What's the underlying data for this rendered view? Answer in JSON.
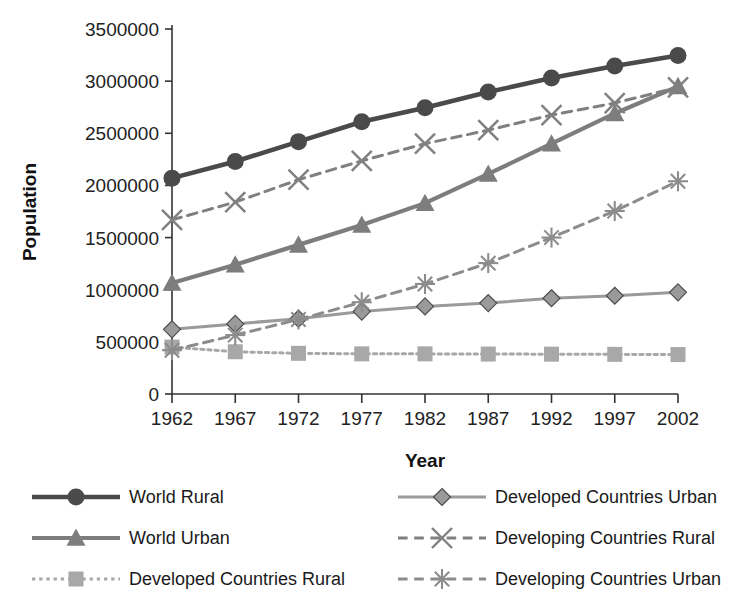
{
  "chart_data": {
    "type": "line",
    "title": "",
    "xlabel": "Year",
    "ylabel": "Population",
    "x": [
      1962,
      1967,
      1972,
      1977,
      1982,
      1987,
      1992,
      1997,
      2002
    ],
    "xtick_labels": [
      "1962",
      "1967",
      "1972",
      "1977",
      "1982",
      "1987",
      "1992",
      "1997",
      "2002"
    ],
    "ytick_labels": [
      "0",
      "500000",
      "1000000",
      "1500000",
      "2000000",
      "2500000",
      "3000000",
      "3500000"
    ],
    "yticks": [
      0,
      500000,
      1000000,
      1500000,
      2000000,
      2500000,
      3000000,
      3500000
    ],
    "ylim": [
      0,
      3500000
    ],
    "grid": false,
    "legend_position": "bottom",
    "series": [
      {
        "name": "World Rural",
        "marker": "circle",
        "dash": "solid",
        "color": "#4a4a4a",
        "values": [
          2070000,
          2230000,
          2420000,
          2610000,
          2745000,
          2895000,
          3030000,
          3145000,
          3245000
        ]
      },
      {
        "name": "World Urban",
        "marker": "triangle",
        "dash": "solid",
        "color": "#7d7d7d",
        "values": [
          1065000,
          1240000,
          1430000,
          1620000,
          1830000,
          2110000,
          2400000,
          2690000,
          2950000
        ]
      },
      {
        "name": "Developed Countries Rural",
        "marker": "square",
        "dash": "dotted",
        "color": "#a8a8a8",
        "values": [
          450000,
          405000,
          390000,
          385000,
          385000,
          383000,
          382000,
          380000,
          378000
        ]
      },
      {
        "name": "Developed Countries Urban",
        "marker": "diamond",
        "dash": "solid",
        "color": "#9a9a9a",
        "values": [
          620000,
          672000,
          722000,
          790000,
          840000,
          872000,
          918000,
          942000,
          975000
        ]
      },
      {
        "name": "Developing Countries Rural",
        "marker": "cross",
        "dash": "dashed",
        "color": "#808080",
        "values": [
          1670000,
          1840000,
          2055000,
          2235000,
          2400000,
          2530000,
          2675000,
          2790000,
          2940000
        ]
      },
      {
        "name": "Developing Countries Urban",
        "marker": "star",
        "dash": "dashed",
        "color": "#8c8c8c",
        "values": [
          420000,
          565000,
          715000,
          880000,
          1055000,
          1255000,
          1500000,
          1755000,
          2040000
        ]
      }
    ]
  },
  "legend": {
    "columns": [
      [
        "World Rural",
        "World Urban",
        "Developed Countries Rural"
      ],
      [
        "Developed Countries Urban",
        "Developing Countries Rural",
        "Developing Countries Urban"
      ]
    ]
  }
}
